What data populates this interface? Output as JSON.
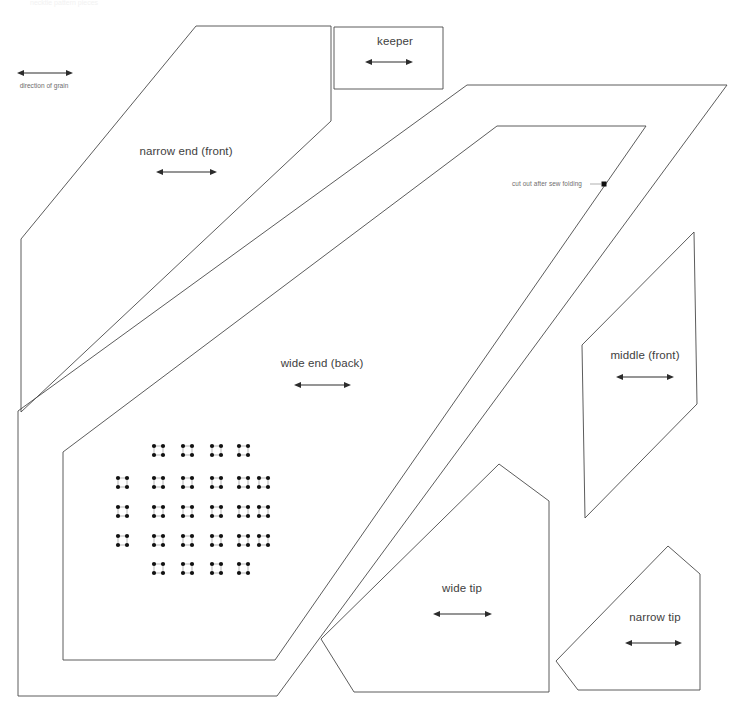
{
  "document": {
    "title": "sewing pattern sheet",
    "header_text": "necktie pattern pieces",
    "background_color": "#ffffff",
    "outline_color": "#4a4a4a",
    "label_color": "#3e3e3e",
    "annotation_color": "#6e6e6e",
    "dot_color": "#111111"
  },
  "grain_legend": {
    "label": "direction of grain",
    "x": 44,
    "y": 86,
    "arrow": {
      "x1": 18,
      "x2": 72,
      "y": 73
    }
  },
  "pieces": [
    {
      "id": "narrow-end-front",
      "label": "narrow end (front)",
      "label_x": 186,
      "label_y": 145,
      "grain": {
        "x1": 157,
        "x2": 216,
        "y": 172
      },
      "points": "196,26 331,26 331,121 21,412 21,239 196,26"
    },
    {
      "id": "keeper",
      "label": "keeper",
      "label_x": 395,
      "label_y": 35,
      "grain": {
        "x1": 366,
        "x2": 412,
        "y": 62
      },
      "points": "334,27 443,27 443,89 334,89 334,27"
    },
    {
      "id": "wide-end-back",
      "label": "wide end (back)",
      "label_x": 322,
      "label_y": 357,
      "grain": {
        "x1": 295,
        "x2": 350,
        "y": 385
      },
      "points": "467,85 727,85 277,696 18,696 18,411 196,223 467,85",
      "outer_path": "M467,85 L727,85 L277,696 L18,696 L18,411 Z",
      "inner_path": "M497,126 L646,126 L275,660 L63,660 L63,452 Z"
    },
    {
      "id": "middle-front",
      "label": "middle (front)",
      "label_x": 645,
      "label_y": 356,
      "grain": {
        "x1": 617,
        "x2": 673,
        "y": 377
      },
      "points": "694,232 697,404 585,518 582,345 694,232"
    },
    {
      "id": "wide-tip",
      "label": "wide tip",
      "label_x": 462,
      "label_y": 588,
      "grain": {
        "x1": 434,
        "x2": 491,
        "y": 614
      },
      "points": "499,464 549,501 549,692 354,692 321,639 499,464"
    },
    {
      "id": "narrow-tip",
      "label": "narrow tip",
      "label_x": 655,
      "label_y": 618,
      "grain": {
        "x1": 626,
        "x2": 681,
        "y": 643
      },
      "points": "668,546 700,574 700,690 578,690 556,661 668,546"
    }
  ],
  "annotations": [
    {
      "id": "cut-out-note",
      "text": "cut out after sew folding",
      "text_x": 547,
      "text_y": 181,
      "leader": {
        "x1": 590,
        "x2": 602,
        "y": 184
      },
      "marker": {
        "x": 604,
        "y": 184,
        "size": 4
      }
    }
  ],
  "dot_grid": {
    "description": "lattice of paired marking dots on the wide end back piece",
    "columns_x": [
      118,
      127,
      154,
      163,
      183,
      192,
      212,
      221,
      239,
      248,
      259,
      268
    ],
    "rows_y": [
      446,
      455,
      478,
      487,
      507,
      516,
      536,
      545,
      564,
      573
    ],
    "dot_radius": 2.1,
    "pair_gap": 9,
    "group_pitch": 29,
    "cols_count": 12,
    "rows_count": 10,
    "omitted_corners": true
  }
}
